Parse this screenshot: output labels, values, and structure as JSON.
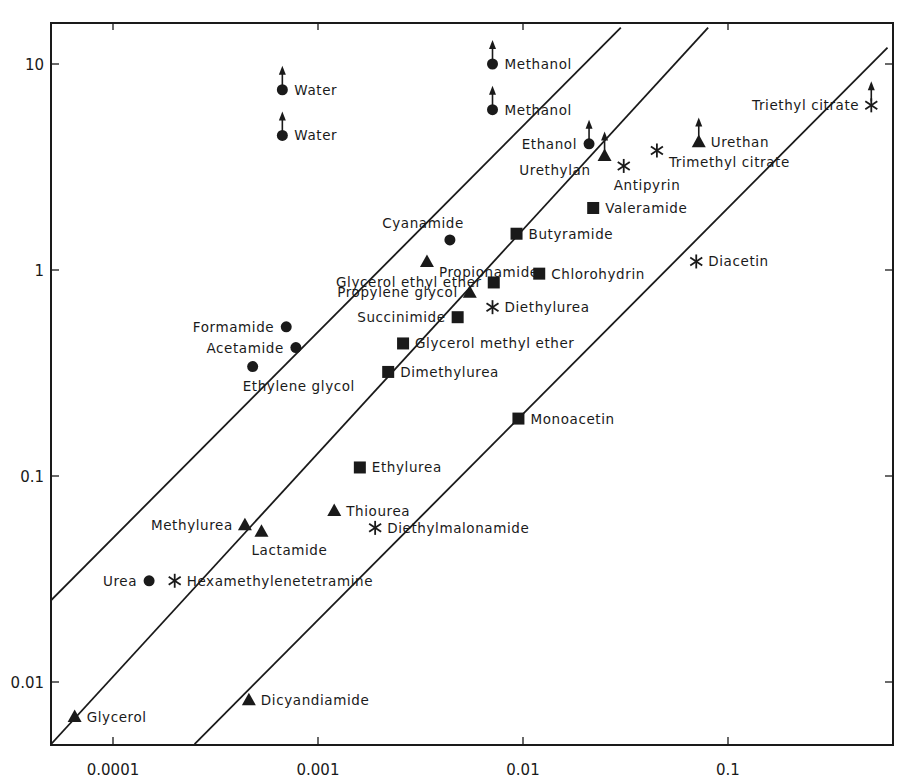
{
  "chart_data": {
    "type": "scatter",
    "title": "",
    "xlabel": "",
    "ylabel": "",
    "x_scale": "log",
    "y_scale": "log",
    "xlim": [
      5e-05,
      0.6
    ],
    "ylim": [
      0.005,
      15
    ],
    "grid": false,
    "legend": "none (points labeled directly)",
    "x_ticks": [
      {
        "value": 0.0001,
        "label": "0.0001"
      },
      {
        "value": 0.001,
        "label": "0.001"
      },
      {
        "value": 0.01,
        "label": "0.01"
      },
      {
        "value": 0.1,
        "label": "0.1"
      }
    ],
    "y_ticks": [
      {
        "value": 10,
        "label": "10"
      },
      {
        "value": 1,
        "label": "1"
      },
      {
        "value": 0.1,
        "label": "0.1"
      },
      {
        "value": 0.01,
        "label": "0.01"
      }
    ],
    "marker_types": [
      "circle",
      "triangle",
      "square",
      "asterisk"
    ],
    "reference_lines": [
      {
        "name": "line-1",
        "from": [
          5e-05,
          0.025
        ],
        "to": [
          0.03,
          15
        ]
      },
      {
        "name": "line-2",
        "from": [
          5e-05,
          0.005
        ],
        "to": [
          0.08,
          15
        ]
      },
      {
        "name": "line-3",
        "from": [
          0.00025,
          0.005
        ],
        "to": [
          0.6,
          12
        ]
      }
    ],
    "points": [
      {
        "label": "Water",
        "x": 0.00067,
        "y": 7.5,
        "marker": "circle",
        "arrow_up": true,
        "label_pos": "right"
      },
      {
        "label": "Water",
        "x": 0.00067,
        "y": 4.5,
        "marker": "circle",
        "arrow_up": true,
        "label_pos": "right"
      },
      {
        "label": "Methanol",
        "x": 0.0071,
        "y": 10,
        "marker": "circle",
        "arrow_up": true,
        "label_pos": "right"
      },
      {
        "label": "Methanol",
        "x": 0.0071,
        "y": 6.0,
        "marker": "circle",
        "arrow_up": true,
        "label_pos": "right"
      },
      {
        "label": "Ethanol",
        "x": 0.021,
        "y": 4.1,
        "marker": "circle",
        "arrow_up": true,
        "label_pos": "left"
      },
      {
        "label": "Urethylan",
        "x": 0.025,
        "y": 3.6,
        "marker": "triangle",
        "arrow_up": true,
        "label_pos": "left-below"
      },
      {
        "label": "Urethan",
        "x": 0.072,
        "y": 4.2,
        "marker": "triangle",
        "arrow_up": true,
        "label_pos": "right"
      },
      {
        "label": "Triethyl citrate",
        "x": 0.5,
        "y": 6.3,
        "marker": "asterisk",
        "arrow_up": true,
        "label_pos": "left"
      },
      {
        "label": "Trimethyl citrate",
        "x": 0.045,
        "y": 3.8,
        "marker": "asterisk",
        "label_pos": "right-below"
      },
      {
        "label": "Antipyrin",
        "x": 0.031,
        "y": 3.2,
        "marker": "asterisk",
        "label_pos": "below"
      },
      {
        "label": "Valeramide",
        "x": 0.022,
        "y": 2.0,
        "marker": "square",
        "label_pos": "right"
      },
      {
        "label": "Butyramide",
        "x": 0.0093,
        "y": 1.5,
        "marker": "square",
        "label_pos": "right"
      },
      {
        "label": "Cyanamide",
        "x": 0.0044,
        "y": 1.4,
        "marker": "circle",
        "label_pos": "above-left"
      },
      {
        "label": "Propionamide",
        "x": 0.0034,
        "y": 1.1,
        "marker": "triangle",
        "label_pos": "right-below"
      },
      {
        "label": "Diacetin",
        "x": 0.07,
        "y": 1.1,
        "marker": "asterisk",
        "label_pos": "right"
      },
      {
        "label": "Chlorohydrin",
        "x": 0.012,
        "y": 0.96,
        "marker": "square",
        "label_pos": "right"
      },
      {
        "label": "Glycerol ethyl ether",
        "x": 0.0072,
        "y": 0.87,
        "marker": "square",
        "label_pos": "left"
      },
      {
        "label": "Propylene glycol",
        "x": 0.0055,
        "y": 0.78,
        "marker": "triangle",
        "label_pos": "left"
      },
      {
        "label": "Diethylurea",
        "x": 0.0071,
        "y": 0.66,
        "marker": "asterisk",
        "label_pos": "right"
      },
      {
        "label": "Succinimide",
        "x": 0.0048,
        "y": 0.59,
        "marker": "square",
        "label_pos": "left"
      },
      {
        "label": "Formamide",
        "x": 0.0007,
        "y": 0.53,
        "marker": "circle",
        "label_pos": "left"
      },
      {
        "label": "Acetamide",
        "x": 0.00078,
        "y": 0.42,
        "marker": "circle",
        "label_pos": "left"
      },
      {
        "label": "Glycerol methyl ether",
        "x": 0.0026,
        "y": 0.44,
        "marker": "square",
        "label_pos": "right"
      },
      {
        "label": "Ethylene glycol",
        "x": 0.00048,
        "y": 0.34,
        "marker": "circle",
        "label_pos": "below"
      },
      {
        "label": "Dimethylurea",
        "x": 0.0022,
        "y": 0.32,
        "marker": "square",
        "label_pos": "right"
      },
      {
        "label": "Monoacetin",
        "x": 0.0095,
        "y": 0.19,
        "marker": "square",
        "label_pos": "right"
      },
      {
        "label": "Ethylurea",
        "x": 0.0016,
        "y": 0.11,
        "marker": "square",
        "label_pos": "right"
      },
      {
        "label": "Thiourea",
        "x": 0.0012,
        "y": 0.068,
        "marker": "triangle",
        "label_pos": "right"
      },
      {
        "label": "Methylurea",
        "x": 0.00044,
        "y": 0.058,
        "marker": "triangle",
        "label_pos": "left"
      },
      {
        "label": "Lactamide",
        "x": 0.00053,
        "y": 0.054,
        "marker": "triangle",
        "label_pos": "below"
      },
      {
        "label": "Diethylmalonamide",
        "x": 0.0019,
        "y": 0.056,
        "marker": "asterisk",
        "label_pos": "right"
      },
      {
        "label": "Urea",
        "x": 0.00015,
        "y": 0.031,
        "marker": "circle",
        "label_pos": "left"
      },
      {
        "label": "Hexamethylenetetramine",
        "x": 0.0002,
        "y": 0.031,
        "marker": "asterisk",
        "label_pos": "right"
      },
      {
        "label": "Glycerol",
        "x": 6.5e-05,
        "y": 0.0068,
        "marker": "triangle",
        "label_pos": "right"
      },
      {
        "label": "Dicyandiamide",
        "x": 0.00046,
        "y": 0.0082,
        "marker": "triangle",
        "label_pos": "right"
      }
    ]
  },
  "colors": {
    "ink": "#1a1a1a",
    "background": "#ffffff"
  }
}
